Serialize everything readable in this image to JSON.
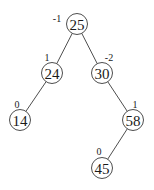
{
  "diagram": {
    "type": "binary-search-tree-balance-factors",
    "colors": {
      "stroke": "#3a3a3a",
      "text": "#1a1a1a",
      "background": "#ffffff"
    },
    "node_radius": 10.5,
    "nodes": [
      {
        "id": "n25",
        "key": "25",
        "balance": "-1",
        "x": 77,
        "y": 24,
        "lx": 57,
        "ly": 18
      },
      {
        "id": "n24",
        "key": "24",
        "balance": "1",
        "x": 52,
        "y": 73,
        "lx": 47,
        "ly": 57
      },
      {
        "id": "n30",
        "key": "30",
        "balance": "-2",
        "x": 102,
        "y": 73,
        "lx": 109,
        "ly": 57
      },
      {
        "id": "n14",
        "key": "14",
        "balance": "0",
        "x": 20,
        "y": 120,
        "lx": 17,
        "ly": 104
      },
      {
        "id": "n58",
        "key": "58",
        "balance": "1",
        "x": 133,
        "y": 120,
        "lx": 135,
        "ly": 104
      },
      {
        "id": "n45",
        "key": "45",
        "balance": "0",
        "x": 102,
        "y": 168,
        "lx": 99,
        "ly": 151
      }
    ],
    "edges": [
      {
        "from": "n25",
        "to": "n24"
      },
      {
        "from": "n25",
        "to": "n30"
      },
      {
        "from": "n24",
        "to": "n14"
      },
      {
        "from": "n30",
        "to": "n58"
      },
      {
        "from": "n58",
        "to": "n45"
      }
    ]
  }
}
